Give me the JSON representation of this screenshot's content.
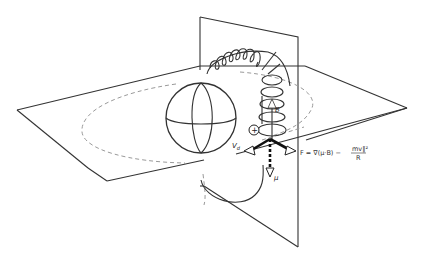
{
  "diagram": {
    "type": "physics-schematic",
    "labels": {
      "charge": "+",
      "field": "B",
      "drift_velocity": "V",
      "drift_velocity_sub": "d",
      "magnetic_moment": "μ",
      "force_prefix": "F = ∇(μ·B) −",
      "force_numerator": "mv∥²",
      "force_denominator": "R"
    },
    "elements": [
      "equatorial-plane",
      "meridian-plane",
      "planet-sphere",
      "field-line",
      "helical-particle-trajectory",
      "drift-path-ellipse",
      "force-vector-triad"
    ],
    "colors": {
      "line": "#333333",
      "dashed": "#9a9a9a",
      "background": "#ffffff"
    }
  }
}
